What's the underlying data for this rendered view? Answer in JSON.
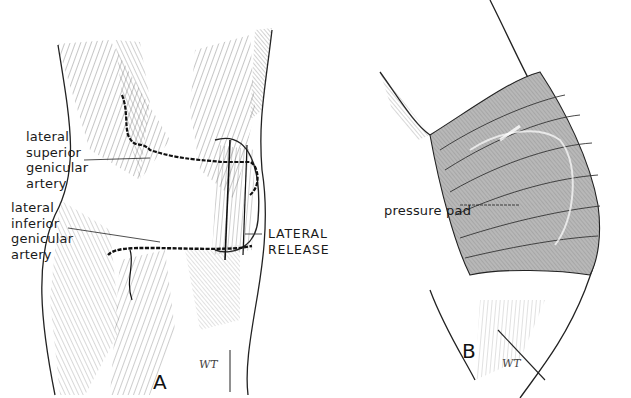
{
  "figure": {
    "panels": [
      {
        "id": "A",
        "label": "A",
        "annotations": {
          "superior": [
            "lateral",
            "superior",
            "genicular",
            "artery"
          ],
          "inferior": [
            "lateral",
            "inferior",
            "genicular",
            "artery"
          ],
          "release": [
            "LATERAL",
            "RELEASE"
          ]
        },
        "signature": "WT"
      },
      {
        "id": "B",
        "label": "B",
        "annotations": {
          "pad": "pressure pad"
        },
        "signature": "WT"
      }
    ],
    "colors": {
      "ink": "#1a1a1a",
      "bandage_fill": "#b8b8b8",
      "background": "#ffffff"
    }
  }
}
